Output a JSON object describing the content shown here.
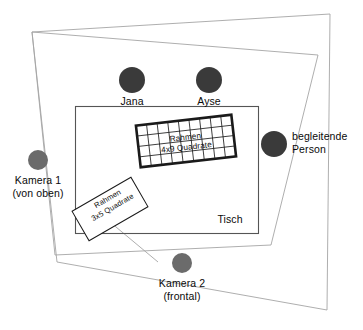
{
  "diagram": {
    "table": {
      "label": "Tisch"
    },
    "frames": [
      {
        "id": "frame-large",
        "name": "Rahmen",
        "spec": "4x9 Quadrate",
        "rows": 4,
        "cols": 9
      },
      {
        "id": "frame-small",
        "name": "Rahmen",
        "spec": "3x5 Quadrate",
        "rows": 3,
        "cols": 5
      }
    ],
    "people": [
      {
        "id": "jana",
        "label": "Jana"
      },
      {
        "id": "ayse",
        "label": "Ayse"
      },
      {
        "id": "begleitperson",
        "label_line1": "begleitende",
        "label_line2": "Person"
      }
    ],
    "cameras": [
      {
        "id": "kamera-1",
        "label_line1": "Kamera 1",
        "label_line2": "(von oben)"
      },
      {
        "id": "kamera-2",
        "label_line1": "Kamera 2",
        "label_line2": "(frontal)"
      }
    ],
    "colors": {
      "person_dot": "#3a3a3a",
      "camera_dot": "#6b6b6b",
      "outline": "#9a9a9a",
      "table_stroke": "#4a4a4a",
      "frame_stroke": "#1a1a1a",
      "text": "#0a0a0a",
      "background": "#ffffff"
    }
  }
}
